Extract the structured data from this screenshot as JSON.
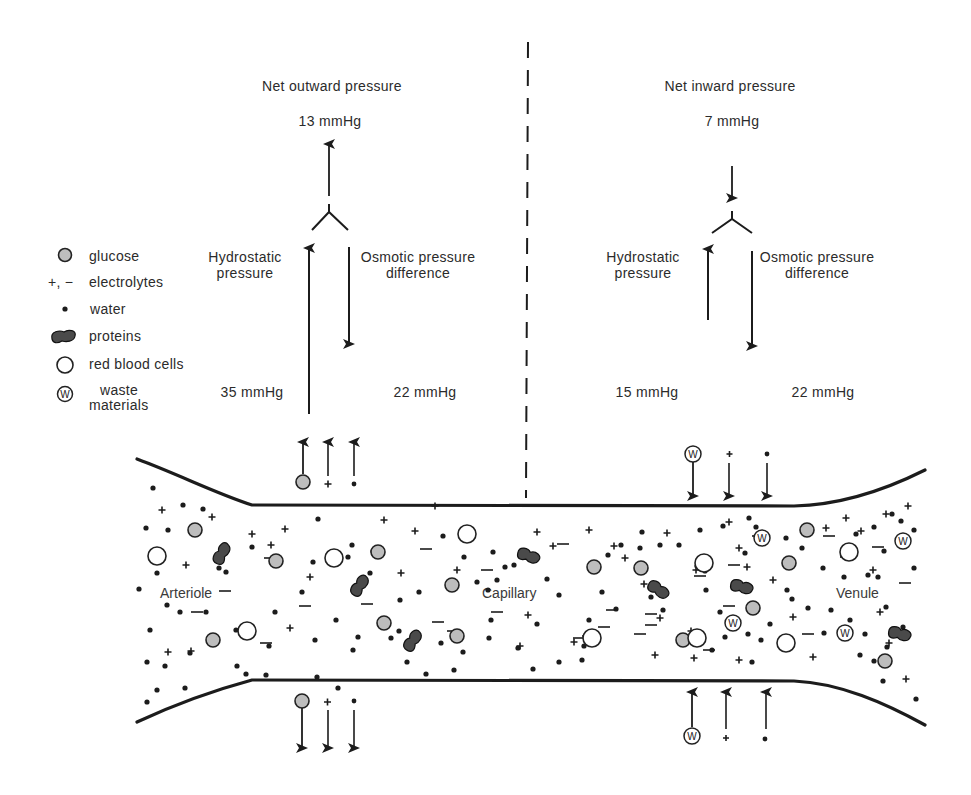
{
  "diagram": {
    "legend": {
      "items": [
        {
          "symbol": "glucose-icon",
          "label": "glucose"
        },
        {
          "symbol": "electrolytes-icon",
          "prefix": "+, −",
          "label": "electrolytes"
        },
        {
          "symbol": "water-icon",
          "label": "water"
        },
        {
          "symbol": "protein-icon",
          "label": "proteins"
        },
        {
          "symbol": "red-blood-cell-icon",
          "label": "red blood cells"
        },
        {
          "symbol": "waste-icon",
          "label_line1": "waste",
          "label_line2": "materials"
        }
      ]
    },
    "arterial_end": {
      "net_label": "Net outward pressure",
      "net_value": "13 mmHg",
      "hydrostatic_line1": "Hydrostatic",
      "hydrostatic_line2": "pressure",
      "hydrostatic_value": "35 mmHg",
      "osmotic_line1": "Osmotic pressure",
      "osmotic_line2": "difference",
      "osmotic_value": "22 mmHg",
      "flux_direction": "outward",
      "flux_substances": [
        "glucose",
        "electrolyte",
        "water"
      ]
    },
    "venous_end": {
      "net_label": "Net inward pressure",
      "net_value": "7 mmHg",
      "hydrostatic_line1": "Hydrostatic",
      "hydrostatic_line2": "pressure",
      "hydrostatic_value": "15 mmHg",
      "osmotic_line1": "Osmotic pressure",
      "osmotic_line2": "difference",
      "osmotic_value": "22 mmHg",
      "flux_direction": "inward",
      "flux_substances": [
        "waste",
        "electrolyte",
        "water"
      ]
    },
    "regions": {
      "arteriole": "Arteriole",
      "capillary": "Capillary",
      "venule": "Venule"
    },
    "waste_glyph": "W",
    "colors": {
      "ink": "#1c1c1c",
      "glucose_fill": "#bdbdbd",
      "protein_fill": "#4a4a4a",
      "background": "#ffffff"
    }
  }
}
